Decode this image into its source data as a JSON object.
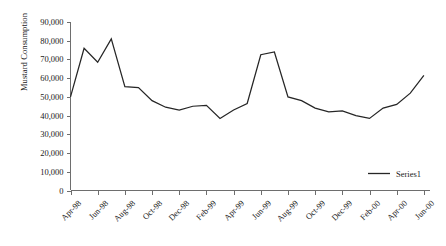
{
  "chart_data": {
    "type": "line",
    "title": "",
    "xlabel": "",
    "ylabel": "Mustard Consumption",
    "ylim": [
      0,
      90000
    ],
    "ytick_step": 10000,
    "grid": false,
    "legend_position": "bottom-right",
    "line_color": "#262626",
    "axis_color": "#6e6e6e",
    "x": [
      "Apr-98",
      "May-98",
      "Jun-98",
      "Jul-98",
      "Aug-98",
      "Sep-98",
      "Oct-98",
      "Nov-98",
      "Dec-98",
      "Jan-99",
      "Feb-99",
      "Mar-99",
      "Apr-99",
      "May-99",
      "Jun-99",
      "Jul-99",
      "Aug-99",
      "Sep-99",
      "Oct-99",
      "Nov-99",
      "Dec-99",
      "Jan-00",
      "Feb-00",
      "Mar-00",
      "Apr-00",
      "May-00",
      "Jun-00"
    ],
    "xtick_labels": [
      "Apr-98",
      "Jun-98",
      "Aug-98",
      "Oct-98",
      "Dec-98",
      "Feb-99",
      "Apr-99",
      "Jun-99",
      "Aug-99",
      "Oct-99",
      "Dec-99",
      "Feb-00",
      "Apr-00",
      "Jun-00"
    ],
    "ytick_labels": [
      "90,000",
      "80,000",
      "70,000",
      "60,000",
      "50,000",
      "40,000",
      "30,000",
      "20,000",
      "10,000",
      "0"
    ],
    "series": [
      {
        "name": "Series1",
        "values": [
          50000,
          76000,
          68500,
          81000,
          55500,
          55000,
          48000,
          44500,
          43000,
          45000,
          45500,
          38500,
          43000,
          46500,
          72500,
          74000,
          50000,
          48000,
          44000,
          42000,
          42500,
          40000,
          38500,
          44000,
          46000,
          52000,
          61500
        ]
      }
    ]
  }
}
